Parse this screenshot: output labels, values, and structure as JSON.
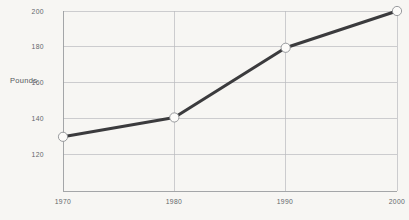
{
  "chart_data": {
    "type": "line",
    "title": "",
    "subtitle": "",
    "xlabel": "",
    "ylabel": "Pounds",
    "categories": [
      "1970",
      "1980",
      "1990",
      "2000"
    ],
    "x": [
      1970,
      1980,
      1990,
      2000
    ],
    "values": [
      135,
      145,
      181,
      200
    ],
    "series": [
      {
        "name": "Pounds",
        "values": [
          135,
          145,
          181,
          200
        ]
      }
    ],
    "xlim": [
      1970,
      2000
    ],
    "ylim": [
      107,
      200
    ],
    "ytick_labels": [
      "120",
      "140",
      "160",
      "180",
      "200"
    ],
    "ytick_values": [
      120,
      140,
      160,
      180,
      200
    ],
    "xtick_labels": [
      "1970",
      "1980",
      "1990",
      "2000"
    ],
    "grid": true,
    "legend": false,
    "legend_position": "none",
    "annotations": [],
    "marker": "circle",
    "colors": {
      "background": "#f7f6f3",
      "line": "#3b3b3d",
      "marker_fill": "#fcfbf9",
      "marker_stroke": "#8e9194",
      "gridline": "#b9bbbd",
      "axis": "#9a9da0",
      "tick_text": "#63676b",
      "label_text": "#54585c"
    }
  }
}
